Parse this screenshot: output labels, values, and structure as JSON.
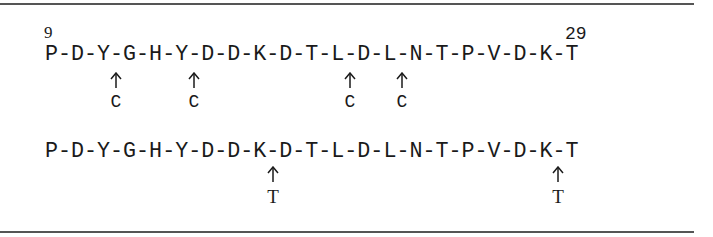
{
  "figure": {
    "panels": [
      {
        "id": "panel-c",
        "start_position": "9",
        "end_position": "29",
        "sequence": "P-D-Y-G-H-Y-D-D-K-D-T-L-D-L-N-T-P-V-D-K-T",
        "residues": [
          "P",
          "D",
          "Y",
          "G",
          "H",
          "Y",
          "D",
          "D",
          "K",
          "D",
          "T",
          "L",
          "D",
          "L",
          "N",
          "T",
          "P",
          "V",
          "D",
          "K",
          "T"
        ],
        "cleavage_sites": [
          {
            "after_residue": "Y",
            "before_residue": "G",
            "char_index": 5,
            "label": "C"
          },
          {
            "after_residue": "Y",
            "before_residue": "D",
            "char_index": 11,
            "label": "C"
          },
          {
            "after_residue": "L",
            "before_residue": "D",
            "char_index": 23,
            "label": "C"
          },
          {
            "after_residue": "L",
            "before_residue": "N",
            "char_index": 27,
            "label": "C"
          }
        ]
      },
      {
        "id": "panel-t",
        "sequence": "P-D-Y-G-H-Y-D-D-K-D-T-L-D-L-N-T-P-V-D-K-T",
        "residues": [
          "P",
          "D",
          "Y",
          "G",
          "H",
          "Y",
          "D",
          "D",
          "K",
          "D",
          "T",
          "L",
          "D",
          "L",
          "N",
          "T",
          "P",
          "V",
          "D",
          "K",
          "T"
        ],
        "cleavage_sites": [
          {
            "after_residue": "K",
            "before_residue": "D",
            "char_index": 17,
            "label": "T"
          },
          {
            "after_residue": "K",
            "before_residue": "T",
            "char_index": 39,
            "label": "T"
          }
        ]
      }
    ],
    "arrow_glyph": "up-arrow",
    "colors": {
      "text": "#1a1a1a",
      "rule": "#555555",
      "background": "#ffffff"
    }
  }
}
